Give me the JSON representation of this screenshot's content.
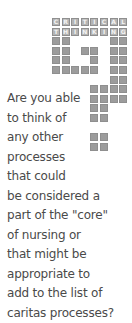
{
  "badge": {
    "title_row_1": [
      "C",
      "R",
      "I",
      "T",
      "I",
      "C",
      "A",
      "L"
    ],
    "title_row_2": [
      "T",
      "H",
      "I",
      "N",
      "K",
      "I",
      "N",
      "G"
    ],
    "colors": {
      "tile": "#9c9c9c",
      "letter_tile": "#b4b4b4",
      "letter": "#f4f4f4"
    }
  },
  "question": {
    "lines": [
      "Are you able",
      "to think of",
      "any other",
      "processes",
      "that could",
      "be considered a",
      "part of the \"core\"",
      "of nursing or",
      "that might be",
      "appropriate to",
      "add to the list of",
      "caritas processes?"
    ],
    "text_color": "#4a4a4a"
  }
}
